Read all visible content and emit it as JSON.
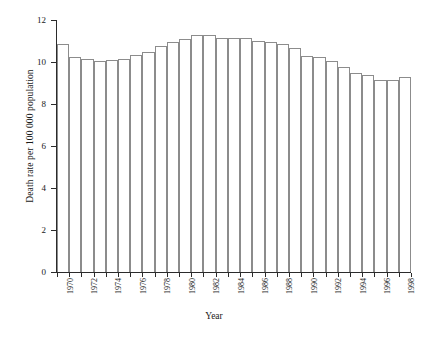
{
  "chart_data": {
    "type": "bar",
    "title": "",
    "xlabel": "Year",
    "ylabel": "Death rate per 100 000 population",
    "categories": [
      1970,
      1971,
      1972,
      1973,
      1974,
      1975,
      1976,
      1977,
      1978,
      1979,
      1980,
      1981,
      1982,
      1983,
      1984,
      1985,
      1986,
      1987,
      1988,
      1989,
      1990,
      1991,
      1992,
      1993,
      1994,
      1995,
      1996,
      1997,
      1998
    ],
    "values": [
      10.85,
      10.25,
      10.15,
      10.05,
      10.1,
      10.15,
      10.35,
      10.5,
      10.75,
      10.95,
      11.1,
      11.3,
      11.3,
      11.15,
      11.15,
      11.15,
      11.0,
      10.95,
      10.85,
      10.65,
      10.3,
      10.25,
      10.05,
      9.75,
      9.5,
      9.4,
      9.15,
      9.15,
      9.3
    ],
    "xtick_labels": [
      "1970",
      "1972",
      "1974",
      "1976",
      "1978",
      "1980",
      "1982",
      "1984",
      "1986",
      "1988",
      "1990",
      "1992",
      "1994",
      "1996",
      "1998"
    ],
    "xtick_years": [
      1970,
      1972,
      1974,
      1976,
      1978,
      1980,
      1982,
      1984,
      1986,
      1988,
      1990,
      1992,
      1994,
      1996,
      1998
    ],
    "ytick_labels": [
      "0",
      "2",
      "4",
      "6",
      "8",
      "10",
      "12"
    ],
    "ytick_values": [
      0,
      2,
      4,
      6,
      8,
      10,
      12
    ],
    "ylim": [
      0,
      12
    ],
    "grid": false,
    "legend": null,
    "bar_edge_color": "#8c8c8c",
    "bar_fill_color": "#ffffff",
    "axis_color": "#2b2b2b"
  }
}
